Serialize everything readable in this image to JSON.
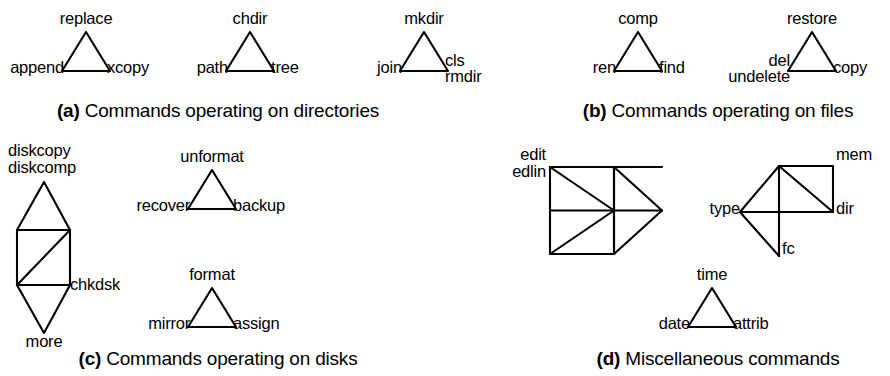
{
  "figure": {
    "background_color": "#ffffff",
    "stroke_color": "#000000",
    "groups": [
      {
        "id": "a",
        "caption_marker": "(a)",
        "caption_text": "Commands operating on directories",
        "shapes": [
          {
            "id": "a1",
            "type": "triangle",
            "labels": {
              "top": "replace",
              "left": "append",
              "right": "xcopy"
            }
          },
          {
            "id": "a2",
            "type": "triangle",
            "labels": {
              "top": "chdir",
              "left": "path",
              "right": "tree"
            }
          },
          {
            "id": "a3",
            "type": "triangle",
            "labels": {
              "top": "mkdir",
              "left": "join",
              "right_upper": "cls",
              "right_lower": "rmdir"
            }
          }
        ]
      },
      {
        "id": "b",
        "caption_marker": "(b)",
        "caption_text": "Commands operating on files",
        "shapes": [
          {
            "id": "b1",
            "type": "triangle",
            "labels": {
              "top": "comp",
              "left": "ren",
              "right": "find"
            }
          },
          {
            "id": "b2",
            "type": "triangle",
            "labels": {
              "top": "restore",
              "left_upper": "del",
              "left_lower": "undelete",
              "right": "copy"
            }
          }
        ]
      },
      {
        "id": "c",
        "caption_marker": "(c)",
        "caption_text": "Commands operating on disks",
        "shapes": [
          {
            "id": "c1",
            "type": "stacked-diamond-rect",
            "labels": {
              "top_upper": "diskcopy",
              "top_lower": "diskcomp",
              "right": "chkdsk",
              "bottom": "more"
            }
          },
          {
            "id": "c2",
            "type": "triangle",
            "labels": {
              "top": "unformat",
              "left": "recover",
              "right": "backup"
            }
          },
          {
            "id": "c3",
            "type": "triangle",
            "labels": {
              "top": "format",
              "left": "mirror",
              "right": "assign"
            }
          }
        ]
      },
      {
        "id": "d",
        "caption_marker": "(d)",
        "caption_text": "Miscellaneous commands",
        "shapes": [
          {
            "id": "d1",
            "type": "pinwheel-square-with-right-fan",
            "labels": {
              "left_upper": "edit",
              "left_lower": "edlin"
            }
          },
          {
            "id": "d2",
            "type": "kite-with-rect",
            "labels": {
              "top_right": "mem",
              "left": "type",
              "right": "dir",
              "bottom": "fc"
            }
          },
          {
            "id": "d3",
            "type": "triangle",
            "labels": {
              "top": "time",
              "left": "date",
              "right": "attrib"
            }
          }
        ]
      }
    ],
    "labels": {
      "replace": "replace",
      "append": "append",
      "xcopy": "xcopy",
      "chdir": "chdir",
      "path": "path",
      "tree": "tree",
      "mkdir": "mkdir",
      "join": "join",
      "cls": "cls",
      "rmdir": "rmdir",
      "comp": "comp",
      "ren": "ren",
      "find": "find",
      "restore": "restore",
      "del": "del",
      "undelete": "undelete",
      "copy": "copy",
      "diskcopy": "diskcopy",
      "diskcomp": "diskcomp",
      "chkdsk": "chkdsk",
      "more": "more",
      "unformat": "unformat",
      "recover": "recover",
      "backup": "backup",
      "format": "format",
      "mirror": "mirror",
      "assign": "assign",
      "edit": "edit",
      "edlin": "edlin",
      "mem": "mem",
      "type": "type",
      "dir": "dir",
      "fc": "fc",
      "time": "time",
      "date": "date",
      "attrib": "attrib"
    },
    "captions": {
      "a_marker": "(a)",
      "a_text": " Commands operating on directories",
      "b_marker": "(b)",
      "b_text": " Commands operating on files",
      "c_marker": "(c)",
      "c_text": " Commands operating on disks",
      "d_marker": "(d)",
      "d_text": " Miscellaneous commands"
    }
  }
}
